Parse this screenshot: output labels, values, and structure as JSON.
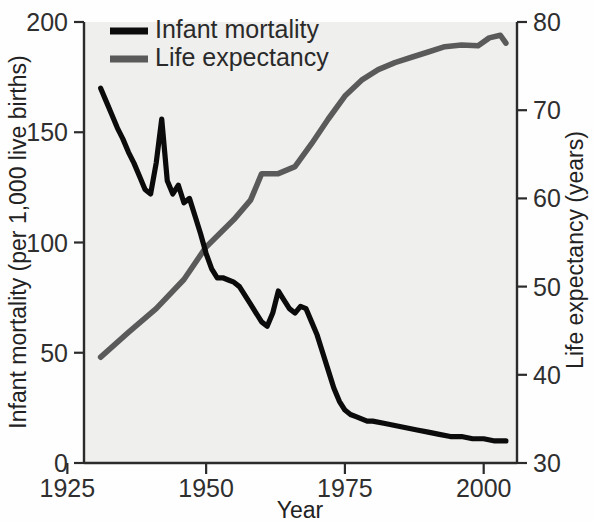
{
  "chart_data": {
    "type": "line",
    "title": "",
    "xlabel": "Year",
    "ylabel": "Infant mortality (per 1,000 live births)",
    "y2label": "Life expectancy (years)",
    "xlim": [
      1928,
      2006
    ],
    "ylim": [
      0,
      200
    ],
    "y2lim": [
      30,
      80
    ],
    "xticks": [
      1925,
      1950,
      1975,
      2000
    ],
    "yticks": [
      0,
      50,
      100,
      150,
      200
    ],
    "y2ticks": [
      30,
      40,
      50,
      60,
      70,
      80
    ],
    "grid": false,
    "legend_position": "top-left",
    "series": [
      {
        "name": "Infant mortality",
        "color": "#0b0b0b",
        "axis": "left",
        "x": [
          1931,
          1932,
          1933,
          1934,
          1935,
          1936,
          1937,
          1938,
          1939,
          1940,
          1941,
          1942,
          1943,
          1944,
          1945,
          1946,
          1947,
          1948,
          1949,
          1950,
          1951,
          1952,
          1953,
          1954,
          1955,
          1956,
          1957,
          1958,
          1959,
          1960,
          1961,
          1962,
          1963,
          1964,
          1965,
          1966,
          1967,
          1968,
          1969,
          1970,
          1971,
          1972,
          1973,
          1974,
          1975,
          1976,
          1977,
          1978,
          1979,
          1980,
          1982,
          1984,
          1986,
          1988,
          1990,
          1992,
          1994,
          1996,
          1998,
          2000,
          2002,
          2004
        ],
        "y": [
          170,
          164,
          158,
          152,
          147,
          141,
          136,
          130,
          124,
          122,
          136,
          156,
          128,
          122,
          126,
          118,
          120,
          112,
          104,
          95,
          88,
          84,
          84,
          83,
          82,
          80,
          76,
          72,
          68,
          64,
          62,
          68,
          78,
          74,
          70,
          68,
          71,
          70,
          64,
          58,
          50,
          42,
          34,
          28,
          24,
          22,
          21,
          20,
          19,
          19,
          18,
          17,
          16,
          15,
          14,
          13,
          12,
          12,
          11,
          11,
          10,
          10
        ]
      },
      {
        "name": "Life expectancy",
        "color": "#5a5a5a",
        "axis": "right",
        "x": [
          1931,
          1936,
          1941,
          1946,
          1950,
          1955,
          1958,
          1960,
          1963,
          1966,
          1969,
          1972,
          1975,
          1978,
          1981,
          1984,
          1987,
          1990,
          1993,
          1996,
          1999,
          2001,
          2003,
          2004
        ],
        "y": [
          42.0,
          44.8,
          47.5,
          50.8,
          54.5,
          57.6,
          59.8,
          62.8,
          62.8,
          63.6,
          66.2,
          69.0,
          71.6,
          73.4,
          74.6,
          75.4,
          76.0,
          76.6,
          77.2,
          77.4,
          77.3,
          78.2,
          78.5,
          77.6
        ]
      }
    ],
    "legend": [
      {
        "label": "Infant mortality",
        "color": "#0b0b0b"
      },
      {
        "label": "Life expectancy",
        "color": "#5a5a5a"
      }
    ]
  },
  "axes": {
    "x_title": "Year",
    "y_left_title": "Infant mortality (per 1,000 live births)",
    "y_right_title": "Life expectancy (years)",
    "x_tick_labels": [
      "1925",
      "1950",
      "1975",
      "2000"
    ],
    "y_left_tick_labels": [
      "0",
      "50",
      "100",
      "150",
      "200"
    ],
    "y_right_tick_labels": [
      "30",
      "40",
      "50",
      "60",
      "70",
      "80"
    ]
  },
  "legend": {
    "item_0_label": "Infant mortality",
    "item_1_label": "Life expectancy"
  },
  "colors": {
    "infant_mortality": "#0b0b0b",
    "life_expectancy": "#5a5a5a",
    "plot_background": "#efefed",
    "axis": "#2b2b2b"
  }
}
